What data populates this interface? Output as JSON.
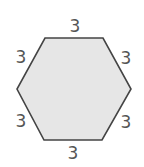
{
  "diagram": {
    "shape": "regular hexagon",
    "fill_color": "#e6e6e6",
    "stroke_color": "#444444",
    "side_labels": {
      "top": "3",
      "upper_right": "3",
      "lower_right": "3",
      "bottom": "3",
      "lower_left": "3",
      "upper_left": "3"
    }
  }
}
